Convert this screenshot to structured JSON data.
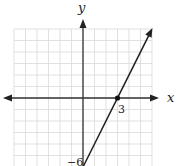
{
  "chart_data": {
    "type": "line",
    "title": "",
    "xlabel": "x",
    "ylabel": "y",
    "xlim": [
      -6,
      6
    ],
    "ylim": [
      -6,
      6
    ],
    "grid": true,
    "grid_step": 1,
    "series": [
      {
        "name": "line",
        "equation": "y = 2x - 6",
        "x": [
          0,
          3,
          6
        ],
        "y": [
          -6,
          0,
          6
        ]
      }
    ],
    "annotations": [
      {
        "text": "3",
        "x": 3,
        "y": 0,
        "marked_point": true
      },
      {
        "text": "−6",
        "x": 0,
        "y": -6,
        "marked_point": false
      }
    ]
  },
  "labels": {
    "x_axis": "x",
    "y_axis": "y",
    "x_intercept": "3",
    "y_intercept": "−6"
  },
  "colors": {
    "grid": "#d9d9d9",
    "axis": "#333333",
    "line": "#222222"
  }
}
